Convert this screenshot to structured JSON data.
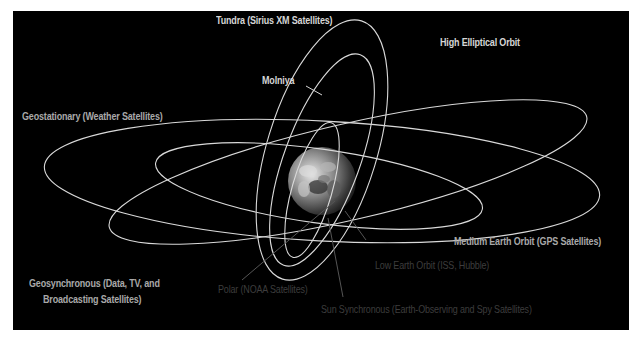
{
  "diagram": {
    "background": "#000000",
    "orbit_color": "#d9d9d9",
    "earth": {
      "cx": 322,
      "cy": 181,
      "r": 34
    },
    "orbits": [
      {
        "name": "geostationary",
        "cx": 322,
        "cy": 181,
        "rx": 278,
        "ry": 60,
        "rot": 3
      },
      {
        "name": "geosynchronous",
        "cx": 348,
        "cy": 172,
        "rx": 245,
        "ry": 48,
        "rot": -13
      },
      {
        "name": "medium-earth-orbit",
        "cx": 319,
        "cy": 186,
        "rx": 165,
        "ry": 37,
        "rot": 8
      },
      {
        "name": "high-elliptical-tundra",
        "cx": 322,
        "cy": 150,
        "rx": 55,
        "ry": 135,
        "rot": 17
      },
      {
        "name": "molniya",
        "cx": 322,
        "cy": 160,
        "rx": 38,
        "ry": 112,
        "rot": 20
      },
      {
        "name": "polar",
        "cx": 312,
        "cy": 190,
        "rx": 20,
        "ry": 70,
        "rot": 16
      }
    ],
    "pointers": [
      {
        "name": "molniya-pointer",
        "x1": 306,
        "y1": 86,
        "x2": 322,
        "y2": 95
      },
      {
        "name": "polar-pointer",
        "x1": 242,
        "y1": 280,
        "x2": 335,
        "y2": 201
      },
      {
        "name": "low-earth-orbit-pointer",
        "x1": 366,
        "y1": 240,
        "x2": 345,
        "y2": 211
      },
      {
        "name": "sun-synchronous-pointer",
        "x1": 343,
        "y1": 297,
        "x2": 328,
        "y2": 218
      }
    ]
  },
  "labels": {
    "tundra": "Tundra (Sirius XM Satellites)",
    "high_elliptical": "High Elliptical Orbit",
    "molniya": "Molniya",
    "geostationary": "Geostationary (Weather Satellites)",
    "medium_earth_orbit": "Medium Earth Orbit (GPS Satellites)",
    "geosynchronous_line1": "Geosynchronous (Data, TV, and",
    "geosynchronous_line2": "Broadcasting Satellites)",
    "low_earth_orbit": "Low Earth Orbit (ISS, Hubble)",
    "polar": "Polar (NOAA Satellites)",
    "sun_synchronous": "Sun Synchronous (Earth-Observing and Spy Satellites)"
  }
}
